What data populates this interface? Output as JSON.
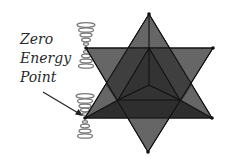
{
  "diagram": {
    "label_lines": [
      "Zero",
      "Energy",
      "Point"
    ],
    "colors": {
      "background": "#ffffff",
      "tetra_face": "#5a5a5a",
      "tetra_overlap": "#3c3c3c",
      "inner_dark": "#2e2e2e",
      "edge": "#111111",
      "spring": "#7a7a7a",
      "text": "#2a2a2a",
      "arrow": "#222222"
    },
    "up_triangle": [
      [
        149,
        14
      ],
      [
        85,
        118
      ],
      [
        212,
        118
      ]
    ],
    "down_triangle": [
      [
        86,
        48
      ],
      [
        213,
        48
      ],
      [
        148,
        152
      ]
    ],
    "inner_center": [
      149,
      85
    ],
    "inner_points": [
      [
        149,
        48
      ],
      [
        118,
        100
      ],
      [
        180,
        100
      ]
    ],
    "springs": [
      {
        "name": "upper",
        "vertex": [
          86,
          48
        ],
        "top": 22,
        "bottom": 70
      },
      {
        "name": "lower",
        "vertex": [
          85,
          118
        ],
        "top": 93,
        "bottom": 141
      }
    ],
    "arrow": {
      "from": [
        43,
        92
      ],
      "to": [
        83,
        116
      ]
    }
  }
}
